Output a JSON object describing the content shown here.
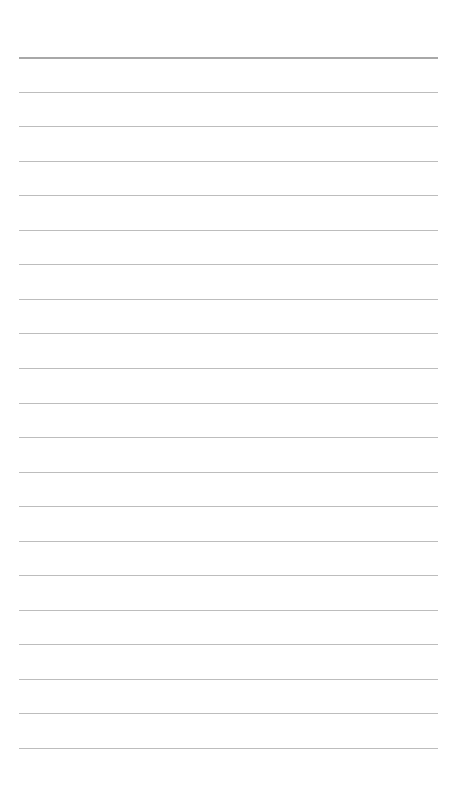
{
  "page": {
    "type": "blank lined sheet",
    "background": "#ffffff",
    "rule_color": "#bdbdbd",
    "top_rule_color": "#a8a8a8",
    "rule_count": 21,
    "first_rule_y": 57,
    "rule_spacing": 34.55,
    "rule_left": 19,
    "rule_width": 419
  }
}
